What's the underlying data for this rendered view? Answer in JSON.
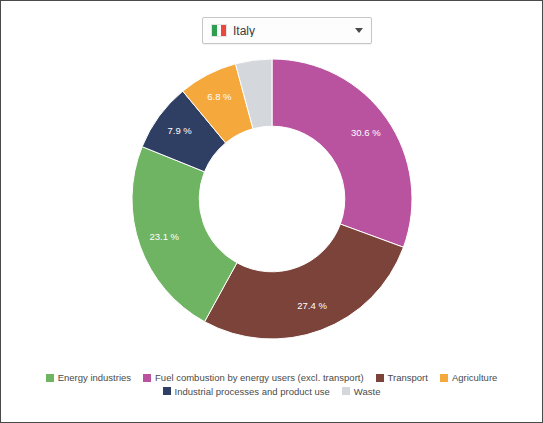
{
  "selector": {
    "label": "Italy",
    "flag_icon": "italy-flag-icon",
    "caret_icon": "chevron-down-icon"
  },
  "chart_data": {
    "type": "pie",
    "variant": "donut",
    "title": "",
    "subtitle": "",
    "xlabel": "",
    "ylabel": "",
    "grid": false,
    "legend_position": "bottom",
    "units": "%",
    "label_suffix": " %",
    "start_angle_deg": 0,
    "direction": "clockwise",
    "inner_radius_ratio": 0.52,
    "categories": [
      "Fuel combustion by energy users (excl. transport)",
      "Transport",
      "Energy industries",
      "Industrial processes and product use",
      "Agriculture",
      "Waste"
    ],
    "values": [
      30.6,
      27.4,
      23.1,
      7.9,
      6.8,
      4.2
    ],
    "labels": [
      "30.6 %",
      "27.4 %",
      "23.1 %",
      "7.9 %",
      "6.8 %",
      ""
    ],
    "colors": [
      "#b9539f",
      "#7b4339",
      "#6fb463",
      "#2f3e63",
      "#f5a councils"
    ],
    "slices": [
      {
        "name": "Fuel combustion by energy users (excl. transport)",
        "value": 30.6,
        "label": "30.6 %",
        "color": "#b9539f",
        "label_visible": true
      },
      {
        "name": "Transport",
        "value": 27.4,
        "label": "27.4 %",
        "color": "#7b4339",
        "label_visible": true
      },
      {
        "name": "Energy industries",
        "value": 23.1,
        "label": "23.1 %",
        "color": "#6fb463",
        "label_visible": true
      },
      {
        "name": "Industrial processes and product use",
        "value": 7.9,
        "label": "7.9 %",
        "color": "#2f3e63",
        "label_visible": true
      },
      {
        "name": "Agriculture",
        "value": 6.8,
        "label": "6.8 %",
        "color": "#f5a83c",
        "label_visible": true
      },
      {
        "name": "Waste",
        "value": 4.2,
        "label": "",
        "color": "#d4d7dc",
        "label_visible": false
      }
    ]
  },
  "legend": {
    "row1": [
      {
        "label": "Energy industries",
        "color": "#6fb463"
      },
      {
        "label": "Fuel combustion by energy users (excl. transport)",
        "color": "#b9539f"
      },
      {
        "label": "Transport",
        "color": "#7b4339"
      },
      {
        "label": "Agriculture",
        "color": "#f5a83c"
      }
    ],
    "row2": [
      {
        "label": "Industrial processes and product use",
        "color": "#2f3e63"
      },
      {
        "label": "Waste",
        "color": "#d4d7dc"
      }
    ]
  }
}
